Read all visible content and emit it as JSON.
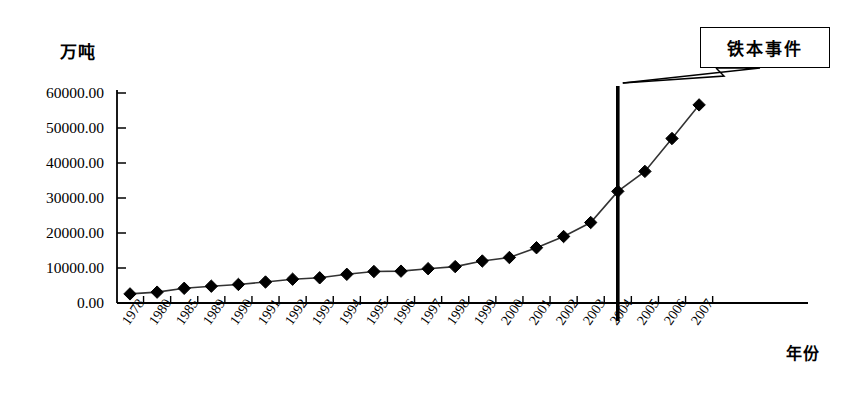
{
  "chart_data": {
    "type": "line",
    "title": "",
    "subtitle": "",
    "xlabel": "年份",
    "ylabel": "万吨",
    "categories": [
      "1978",
      "1980",
      "1985",
      "1989",
      "1990",
      "1991",
      "1992",
      "1993",
      "1994",
      "1995",
      "1996",
      "1997",
      "1998",
      "1999",
      "2000",
      "2001",
      "2002",
      "2003",
      "2004",
      "2005",
      "2006",
      "2007"
    ],
    "values": [
      2600,
      3100,
      4200,
      4800,
      5300,
      6000,
      6800,
      7200,
      8200,
      9000,
      9100,
      9800,
      10400,
      12000,
      13000,
      15800,
      19000,
      23000,
      31900,
      37600,
      47000,
      56600
    ],
    "series": [
      {
        "name": "粗钢产量",
        "values": [
          2600,
          3100,
          4200,
          4800,
          5300,
          6000,
          6800,
          7200,
          8200,
          9000,
          9100,
          9800,
          10400,
          12000,
          13000,
          15800,
          19000,
          23000,
          31900,
          37600,
          47000,
          56600
        ]
      }
    ],
    "ylim": [
      0,
      60000
    ],
    "yticks": [
      0,
      10000,
      20000,
      30000,
      40000,
      50000,
      60000
    ],
    "ytick_labels": [
      "0.00",
      "10000.00",
      "20000.00",
      "30000.00",
      "40000.00",
      "50000.00",
      "60000.00"
    ],
    "grid": false,
    "legend": "none",
    "marker": "diamond",
    "marker_color": "#000000",
    "line_color": "#333333",
    "axis_color": "#000000",
    "annotations": [
      {
        "label": "铁本事件",
        "type": "callout",
        "points_to_category": "2004",
        "marker_type": "vertical-line"
      }
    ]
  },
  "axes": {
    "y_title": "万吨",
    "x_title": "年份"
  },
  "annotation": {
    "callout_label": "铁本事件"
  },
  "colors": {
    "ink": "#000000",
    "line": "#333333",
    "background": "#ffffff"
  }
}
